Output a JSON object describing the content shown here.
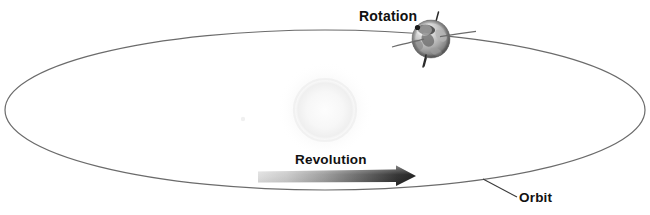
{
  "diagram": {
    "labels": {
      "rotation": "Rotation",
      "revolution": "Revolution",
      "orbit": "Orbit"
    },
    "colors": {
      "background": "#ffffff",
      "orbit_line": "#6b6b6b",
      "sun_glow": "#f4f4f4",
      "arrow_light": "#d8d8d8",
      "arrow_dark": "#1c1c1c",
      "label_text": "#111111",
      "globe_light": "#e8e8e8",
      "globe_mid": "#9a9a9a",
      "globe_dark": "#3a3a3a",
      "axis_line": "#2b2b2b",
      "leader_line": "#3a3a3a"
    },
    "elements": {
      "orbit_ellipse": {
        "center_x": 325,
        "center_y": 110,
        "radius_x": 320,
        "radius_y": 80,
        "stroke_width": 1.2
      },
      "sun": {
        "center_x": 325,
        "center_y": 110,
        "radius": 33
      },
      "earth_globe": {
        "center_x": 431,
        "center_y": 39,
        "radius": 19
      },
      "rotation_axis": {
        "x1": 438,
        "y1": 12,
        "x2": 424,
        "y2": 66,
        "tilt_degrees": 15
      },
      "revolution_arrow": {
        "start_x": 258,
        "end_x": 416,
        "y": 176,
        "thickness": 11,
        "direction": "right"
      },
      "orbit_leader_line": {
        "x1": 483,
        "y1": 179,
        "x2": 517,
        "y2": 197
      }
    }
  }
}
